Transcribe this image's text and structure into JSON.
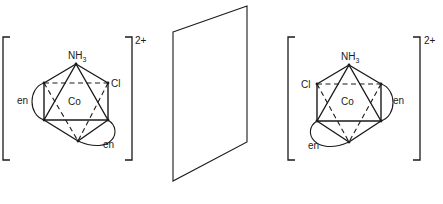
{
  "figure": {
    "left_complex": {
      "top_ligand": "NH",
      "top_ligand_subscript": "3",
      "side_ligand": "Cl",
      "center_metal": "Co",
      "chelate_1": "en",
      "chelate_2": "en",
      "charge": "2+"
    },
    "mirror": {
      "label": ""
    },
    "right_complex": {
      "top_ligand": "NH",
      "top_ligand_subscript": "3",
      "side_ligand": "Cl",
      "center_metal": "Co",
      "chelate_1": "en",
      "chelate_2": "en",
      "charge": "2+"
    }
  }
}
